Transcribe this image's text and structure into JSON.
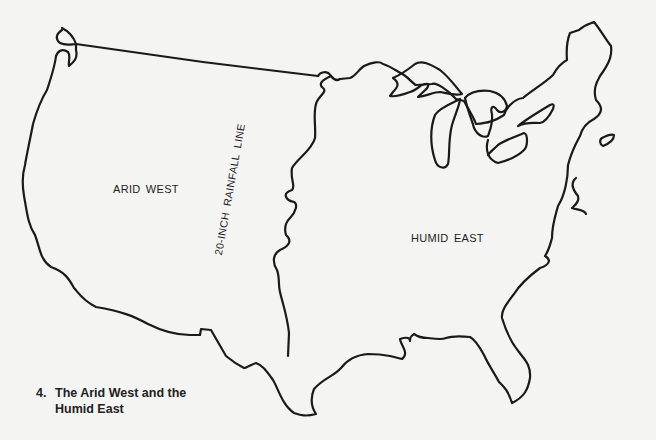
{
  "map": {
    "regions": [
      {
        "id": "arid",
        "label": "ARID WEST"
      },
      {
        "id": "humid",
        "label": "HUMID EAST"
      }
    ],
    "divider": {
      "label": "20-INCH RAINFALL LINE"
    },
    "colors": {
      "outline": "#1a1a1a",
      "background": "#f4f4f3",
      "text": "#222222"
    }
  },
  "caption": {
    "number": "4.",
    "line1": "The Arid West and the",
    "line2": "Humid East"
  }
}
